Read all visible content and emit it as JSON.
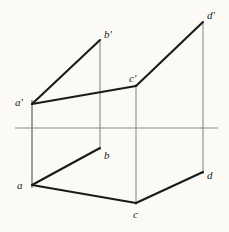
{
  "drawing": {
    "title": "Orthographic projection of quadrilateral ABCD",
    "type": "descriptive-geometry-projection",
    "background_color": "#fbfaf7",
    "stroke_color": "#1a1a1a",
    "projector_color": "#8a8a8a",
    "ground_line_color": "#8a8a8a",
    "canvas": {
      "width": 229,
      "height": 232
    }
  },
  "ground_line": {
    "label": "",
    "x1": 15,
    "y1": 128,
    "x2": 218,
    "y2": 128,
    "width": 1.1,
    "color": "#8a8a8a"
  },
  "points": [
    {
      "id": "a-prime",
      "label": "a'",
      "x": 32,
      "y": 104,
      "view": "front",
      "label_x": 15,
      "label_y": 97
    },
    {
      "id": "b-prime",
      "label": "b'",
      "x": 100,
      "y": 40,
      "view": "front",
      "label_x": 104,
      "label_y": 29
    },
    {
      "id": "c-prime",
      "label": "c'",
      "x": 136,
      "y": 86,
      "view": "front",
      "label_x": 129,
      "label_y": 73
    },
    {
      "id": "d-prime",
      "label": "d'",
      "x": 203,
      "y": 22,
      "view": "front",
      "label_x": 207,
      "label_y": 10
    },
    {
      "id": "a",
      "label": "a",
      "x": 32,
      "y": 185,
      "view": "top",
      "label_x": 17,
      "label_y": 180
    },
    {
      "id": "b",
      "label": "b",
      "x": 100,
      "y": 148,
      "view": "top",
      "label_x": 104,
      "label_y": 150
    },
    {
      "id": "c",
      "label": "c",
      "x": 136,
      "y": 203,
      "view": "top",
      "label_x": 133,
      "label_y": 209
    },
    {
      "id": "d",
      "label": "d",
      "x": 203,
      "y": 172,
      "view": "top",
      "label_x": 207,
      "label_y": 170
    }
  ],
  "edges": [
    {
      "id": "edge-ap-bp",
      "from": "a-prime",
      "to": "b-prime",
      "x1": 32,
      "y1": 104,
      "x2": 100,
      "y2": 40,
      "width": 2.1,
      "color": "#1a1a1a"
    },
    {
      "id": "edge-ap-cp",
      "from": "a-prime",
      "to": "c-prime",
      "x1": 32,
      "y1": 104,
      "x2": 136,
      "y2": 86,
      "width": 2.1,
      "color": "#1a1a1a"
    },
    {
      "id": "edge-cp-dp",
      "from": "c-prime",
      "to": "d-prime",
      "x1": 136,
      "y1": 86,
      "x2": 203,
      "y2": 22,
      "width": 2.1,
      "color": "#1a1a1a"
    },
    {
      "id": "edge-a-b",
      "from": "a",
      "to": "b",
      "x1": 32,
      "y1": 185,
      "x2": 100,
      "y2": 148,
      "width": 2.1,
      "color": "#1a1a1a"
    },
    {
      "id": "edge-a-c",
      "from": "a",
      "to": "c",
      "x1": 32,
      "y1": 185,
      "x2": 136,
      "y2": 203,
      "width": 2.1,
      "color": "#1a1a1a"
    },
    {
      "id": "edge-c-d",
      "from": "c",
      "to": "d",
      "x1": 136,
      "y1": 203,
      "x2": 203,
      "y2": 172,
      "width": 2.1,
      "color": "#1a1a1a"
    }
  ],
  "projectors": [
    {
      "id": "projector-a",
      "through": "a",
      "x": 32,
      "y1": 100,
      "y2": 188,
      "width": 1.3,
      "color": "#6f6f6f"
    },
    {
      "id": "projector-b",
      "through": "b",
      "x": 100,
      "y1": 40,
      "y2": 150,
      "width": 1.1,
      "color": "#8a8a8a"
    },
    {
      "id": "projector-c",
      "through": "c",
      "x": 136,
      "y1": 84,
      "y2": 205,
      "width": 1.1,
      "color": "#8a8a8a"
    },
    {
      "id": "projector-d",
      "through": "d",
      "x": 203,
      "y1": 22,
      "y2": 174,
      "width": 1.1,
      "color": "#8a8a8a"
    }
  ]
}
